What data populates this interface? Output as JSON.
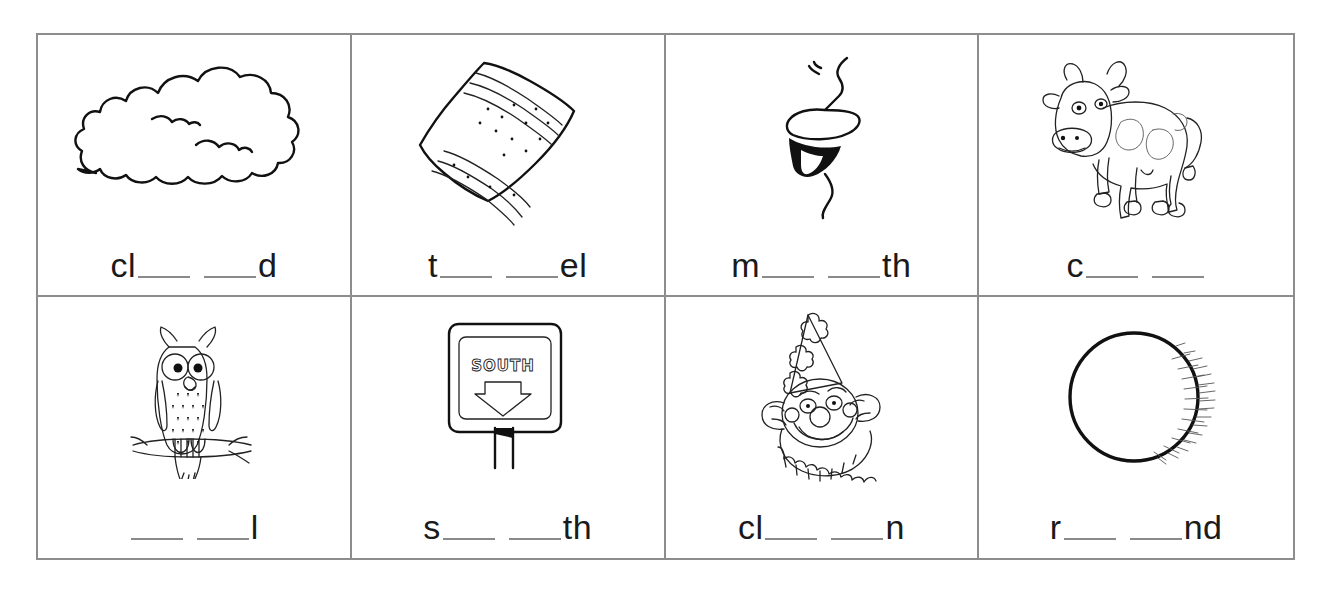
{
  "worksheet": {
    "title": "Phonics fill-in-the-blank picture worksheet",
    "border_color": "#8d8d8d",
    "blank_color": "#8a8a8a",
    "ink_color": "#111111",
    "background": "#ffffff",
    "columns": 4,
    "rows": 2
  },
  "cells": [
    {
      "id": "cell-1",
      "picture": "cloud-drawing",
      "picture_label": "cloud",
      "lead": "cl",
      "tail": "d",
      "blanks": 2,
      "prompt_text": "cl__ __d"
    },
    {
      "id": "cell-2",
      "picture": "towel-drawing",
      "picture_label": "towel",
      "lead": "t",
      "tail": "el",
      "blanks": 2,
      "prompt_text": "t__ __el"
    },
    {
      "id": "cell-3",
      "picture": "mouth-drawing",
      "picture_label": "mouth",
      "lead": "m",
      "tail": "th",
      "blanks": 2,
      "prompt_text": "m__ __th"
    },
    {
      "id": "cell-4",
      "picture": "cow-drawing",
      "picture_label": "cow",
      "lead": "c",
      "tail": "",
      "blanks": 2,
      "prompt_text": "c__ __"
    },
    {
      "id": "cell-5",
      "picture": "owl-drawing",
      "picture_label": "owl",
      "lead": "",
      "tail": "l",
      "blanks": 2,
      "prompt_text": "__ __l"
    },
    {
      "id": "cell-6",
      "picture": "south-sign-drawing",
      "picture_label": "south sign",
      "sign_text": "SOUTH",
      "lead": "s",
      "tail": "th",
      "blanks": 2,
      "prompt_text": "s__ __th"
    },
    {
      "id": "cell-7",
      "picture": "clown-drawing",
      "picture_label": "clown",
      "lead": "cl",
      "tail": "n",
      "blanks": 2,
      "prompt_text": "cl__ __n"
    },
    {
      "id": "cell-8",
      "picture": "round-ball-drawing",
      "picture_label": "round ball",
      "lead": "r",
      "tail": "nd",
      "blanks": 2,
      "prompt_text": "r__ __nd"
    }
  ]
}
